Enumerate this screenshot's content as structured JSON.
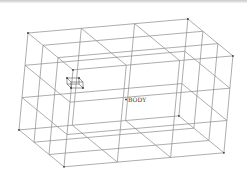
{
  "viewport": {
    "width": 247,
    "height": 193,
    "background": "#ffffff",
    "line_color": "#8a8a8a",
    "vertex_color": "#333333"
  },
  "model": {
    "type": "wireframe-box-lattice",
    "divisions": [
      3,
      3,
      3
    ],
    "origin": [
      28,
      33
    ],
    "axis_u": [
      53.3,
      -4.67
    ],
    "axis_v": [
      -3.0,
      32.3
    ],
    "axis_w": [
      15.0,
      12.3
    ]
  },
  "labels": {
    "body": {
      "text": "BODY",
      "x": 127,
      "y": 101
    }
  },
  "marker": {
    "name": "coordinate-system-marker",
    "x": 66,
    "y": 78
  }
}
